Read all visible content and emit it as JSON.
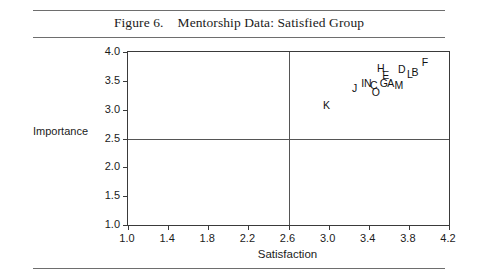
{
  "figure": {
    "number_label": "Figure 6.",
    "title": "Mentorship Data: Satisfied Group"
  },
  "chart_data": {
    "type": "scatter",
    "title": "Mentorship Data: Satisfied Group",
    "xlabel": "Satisfaction",
    "ylabel": "Importance",
    "xlim": [
      1.0,
      4.2
    ],
    "ylim": [
      1.0,
      4.0
    ],
    "xticks": [
      1.0,
      1.4,
      1.8,
      2.2,
      2.6,
      3.0,
      3.4,
      3.8,
      4.2
    ],
    "xtick_labels": [
      "1.0",
      "1.4",
      "1.8",
      "2.2",
      "2.6",
      "3.0",
      "3.4",
      "3.8",
      "4.2"
    ],
    "yticks": [
      1.0,
      1.5,
      2.0,
      2.5,
      3.0,
      3.5,
      4.0
    ],
    "ytick_labels": [
      "1.0",
      "1.5",
      "2.0",
      "2.5",
      "3.0",
      "3.5",
      "4.0"
    ],
    "grid": false,
    "legend": null,
    "reference_lines": {
      "vertical_x": 2.6,
      "horizontal_y": 2.5
    },
    "point_label_style": "letter",
    "points": [
      {
        "label": "A",
        "x": 3.62,
        "y": 3.46
      },
      {
        "label": "B",
        "x": 3.86,
        "y": 3.66
      },
      {
        "label": "C",
        "x": 3.45,
        "y": 3.43
      },
      {
        "label": "D",
        "x": 3.73,
        "y": 3.7
      },
      {
        "label": "E",
        "x": 3.57,
        "y": 3.6
      },
      {
        "label": "F",
        "x": 3.96,
        "y": 3.82
      },
      {
        "label": "G",
        "x": 3.55,
        "y": 3.46
      },
      {
        "label": "H",
        "x": 3.52,
        "y": 3.73
      },
      {
        "label": "I",
        "x": 3.34,
        "y": 3.46
      },
      {
        "label": "J",
        "x": 3.26,
        "y": 3.38
      },
      {
        "label": "K",
        "x": 2.98,
        "y": 3.08
      },
      {
        "label": "L",
        "x": 3.81,
        "y": 3.61
      },
      {
        "label": "M",
        "x": 3.7,
        "y": 3.43
      },
      {
        "label": "N",
        "x": 3.39,
        "y": 3.47
      },
      {
        "label": "O",
        "x": 3.47,
        "y": 3.3
      }
    ]
  }
}
